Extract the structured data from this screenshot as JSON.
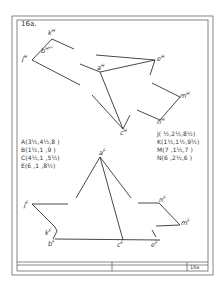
{
  "sheet": {
    "title": "16a.",
    "title_block_id": "16a"
  },
  "points_left": [
    {
      "label": "A",
      "coords": "A(3½,4½,8 )"
    },
    {
      "label": "B",
      "coords": "B(1½,1 ,9 )"
    },
    {
      "label": "C",
      "coords": "C(4½,1 ,5½)"
    },
    {
      "label": "E",
      "coords": "E(6 ,1 ,8½)"
    }
  ],
  "points_right": [
    {
      "label": "J",
      "coords": "J( ½,2½,8½)"
    },
    {
      "label": "K",
      "coords": "K(1½,1½,9½)"
    },
    {
      "label": "M",
      "coords": "M(7 ,1½,7 )"
    },
    {
      "label": "N",
      "coords": "N(6 ,2½,6 )"
    }
  ],
  "horizontal_view_labels": {
    "k": "k",
    "j": "j",
    "b": "b",
    "a": "a",
    "e": "e",
    "c": "c",
    "n": "n",
    "m": "m",
    "sup": "H",
    "b_extra": "ᴴᴾ"
  },
  "frontal_view_labels": {
    "a": "a",
    "j": "j",
    "k": "k",
    "b": "b",
    "c": "c",
    "e": "e",
    "n": "n",
    "m": "m",
    "sup": "F"
  },
  "colors": {
    "line": "#333333",
    "border": "#555555",
    "background": "#ffffff"
  }
}
